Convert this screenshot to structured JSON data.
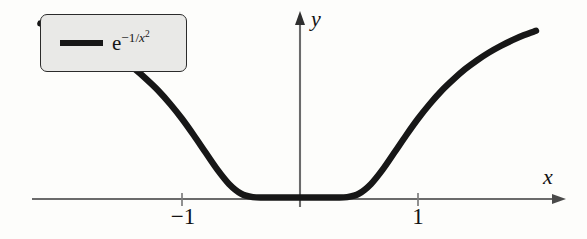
{
  "figure": {
    "background_color": "#fdfdfb",
    "curve_color": "#171717",
    "axis_color": "#6b6b6b",
    "legend_fill": "#e9e9e7",
    "legend_border": "#2b2b2b"
  },
  "legend": {
    "swatch_name": "curve-line-swatch",
    "label_base": "e",
    "label_exponent_prefix": "−1/",
    "label_exponent_variable": "x",
    "label_exponent_power": "2",
    "label_plain": "e^(−1/x²)"
  },
  "axes": {
    "x_label": "x",
    "y_label": "y",
    "x_ticks": [
      {
        "label": "−1",
        "value": -1
      },
      {
        "label": "1",
        "value": 1
      }
    ],
    "y_ticks": []
  },
  "chart_data": {
    "type": "line",
    "title": "",
    "xlabel": "x",
    "ylabel": "y",
    "grid": false,
    "legend_position": "top-left",
    "xlim": [
      -2.2,
      2.4
    ],
    "ylim": [
      -0.06,
      1.02
    ],
    "series": [
      {
        "name": "e^(−1/x²)",
        "color": "#171717",
        "x": [
          -2.2,
          -2.1,
          -2.0,
          -1.9,
          -1.8,
          -1.7,
          -1.6,
          -1.5,
          -1.4,
          -1.3,
          -1.2,
          -1.1,
          -1.0,
          -0.9,
          -0.8,
          -0.7,
          -0.6,
          -0.5,
          -0.4,
          -0.3,
          -0.2,
          -0.1,
          0.0,
          0.1,
          0.2,
          0.3,
          0.4,
          0.5,
          0.6,
          0.7,
          0.8,
          0.9,
          1.0,
          1.1,
          1.2,
          1.3,
          1.4,
          1.5,
          1.6,
          1.7,
          1.8,
          1.9,
          2.0,
          2.1,
          2.2,
          2.3,
          2.4
        ],
        "y": [
          0.813,
          0.798,
          0.779,
          0.759,
          0.735,
          0.708,
          0.677,
          0.641,
          0.6,
          0.552,
          0.499,
          0.437,
          0.368,
          0.291,
          0.21,
          0.13,
          0.062,
          0.018,
          0.002,
          0.0,
          0.0,
          0.0,
          0.0,
          0.0,
          0.0,
          0.0,
          0.002,
          0.018,
          0.062,
          0.13,
          0.21,
          0.291,
          0.368,
          0.437,
          0.499,
          0.552,
          0.6,
          0.641,
          0.677,
          0.708,
          0.735,
          0.759,
          0.779,
          0.798,
          0.813,
          0.828,
          0.841
        ]
      }
    ]
  }
}
